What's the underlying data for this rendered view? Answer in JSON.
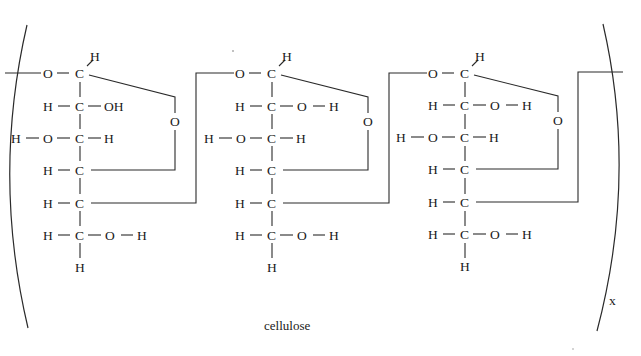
{
  "figure": {
    "caption": "cellulose",
    "repeat_subscript": "x",
    "type": "polymer-structural-formula",
    "units_shown": 3
  },
  "units": [
    {
      "anomeric_h": "H",
      "rows": [
        {
          "left": "",
          "left2": "O",
          "center": "C",
          "right": "",
          "right2": ""
        },
        {
          "left": "H",
          "center": "C",
          "right": "OH",
          "right2": ""
        },
        {
          "left": "H",
          "left2": "O",
          "center": "C",
          "right": "H"
        },
        {
          "left": "H",
          "center": "C"
        },
        {
          "left": "H",
          "center": "C"
        },
        {
          "left": "H",
          "center": "C",
          "right": "O",
          "right2": "H"
        },
        {
          "center": "H"
        }
      ],
      "ring_oxygen": "O"
    },
    {
      "anomeric_h": "H",
      "rows": [
        {
          "left2": "O",
          "center": "C"
        },
        {
          "left": "H",
          "center": "C",
          "right": "O",
          "right2": "H"
        },
        {
          "left": "H",
          "left2": "O",
          "center": "C",
          "right": "H"
        },
        {
          "left": "H",
          "center": "C"
        },
        {
          "left": "H",
          "center": "C"
        },
        {
          "left": "H",
          "center": "C",
          "right": "O",
          "right2": "H"
        },
        {
          "center": "H"
        }
      ],
      "ring_oxygen": "O"
    },
    {
      "anomeric_h": "H",
      "rows": [
        {
          "left2": "O",
          "center": "C"
        },
        {
          "left": "H",
          "center": "C",
          "right": "O",
          "right2": "H"
        },
        {
          "left": "H",
          "left2": "O",
          "center": "C",
          "right": "H"
        },
        {
          "left": "H",
          "center": "C"
        },
        {
          "left": "H",
          "center": "C"
        },
        {
          "left": "H",
          "center": "C",
          "right": "O",
          "right2": "H"
        },
        {
          "center": "H"
        }
      ],
      "ring_oxygen": "O"
    }
  ]
}
